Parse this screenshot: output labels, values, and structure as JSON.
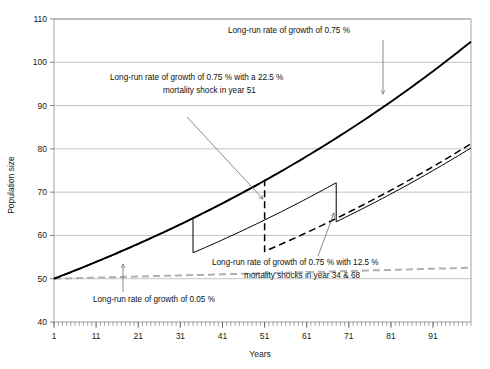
{
  "chart_data": {
    "type": "line",
    "title": "",
    "xlabel": "Years",
    "ylabel": "Population size",
    "xlim": [
      1,
      100
    ],
    "ylim": [
      40,
      110
    ],
    "yticks": [
      40,
      50,
      60,
      70,
      80,
      90,
      100,
      110
    ],
    "xticks": [
      1,
      11,
      21,
      31,
      41,
      51,
      61,
      71,
      81,
      91
    ],
    "xminor_step": 1,
    "grid": true,
    "legend": "none (in-plot text annotations with leader arrows)",
    "start_value": 50,
    "series": [
      {
        "name": "Long-run rate of growth of 0.75 %",
        "style": "solid-thick",
        "color": "#000000",
        "growth_rate_pct": 0.75,
        "shocks": [],
        "x": [
          1,
          11,
          21,
          31,
          41,
          51,
          61,
          71,
          81,
          91,
          100
        ],
        "values": [
          50.0,
          53.9,
          58.0,
          62.5,
          67.4,
          72.6,
          78.2,
          84.2,
          90.7,
          97.7,
          104.6
        ]
      },
      {
        "name": "Long-run rate of growth of 0.75 % with a 22.5 % mortality shock in year 51",
        "style": "dashed-black",
        "color": "#000000",
        "growth_rate_pct": 0.75,
        "shocks": [
          {
            "year": 51,
            "drop_pct": 22.5
          }
        ],
        "x": [
          1,
          11,
          21,
          31,
          41,
          50,
          51,
          61,
          71,
          81,
          91,
          100
        ],
        "values": [
          50.0,
          53.9,
          58.0,
          62.5,
          67.4,
          72.1,
          55.9,
          60.2,
          64.8,
          69.8,
          75.2,
          80.5
        ]
      },
      {
        "name": "Long-run rate of growth of 0.75 % with 12.5 % mortality shocks in year 34 & 68",
        "style": "solid-thin",
        "color": "#000000",
        "growth_rate_pct": 0.75,
        "shocks": [
          {
            "year": 34,
            "drop_pct": 12.5
          },
          {
            "year": 68,
            "drop_pct": 12.5
          }
        ],
        "x": [
          1,
          11,
          21,
          31,
          33,
          34,
          41,
          51,
          61,
          67,
          68,
          71,
          81,
          91,
          100
        ],
        "values": [
          50.0,
          53.9,
          58.0,
          62.5,
          64.4,
          56.3,
          59.4,
          64.0,
          68.9,
          72.1,
          63.1,
          64.5,
          69.5,
          74.9,
          80.2
        ]
      },
      {
        "name": "Long-run rate of growth of 0.05 %",
        "style": "dashed-gray",
        "color": "#b0b0b0",
        "growth_rate_pct": 0.05,
        "shocks": [],
        "note": "plotted slightly above the shocked series, reaching ~82 at year 100",
        "x": [
          1,
          11,
          21,
          31,
          41,
          51,
          61,
          71,
          81,
          91,
          100
        ],
        "values": [
          50.0,
          53.1,
          56.3,
          59.6,
          63.0,
          66.4,
          69.9,
          73.4,
          76.9,
          80.2,
          82.1
        ]
      }
    ],
    "annotations": [
      {
        "id": "annot-growth-075",
        "lines": [
          "Long-run rate of growth of 0.75 %"
        ],
        "text_x_px": 228,
        "text_y_px": 33,
        "arrow_from": [
          383,
          40
        ],
        "arrow_to": [
          383,
          94
        ]
      },
      {
        "id": "annot-shock-225",
        "lines": [
          "Long-run rate of growth of 0.75 % with a 22.5 %",
          "mortality shock in year 51"
        ],
        "text_x_px": 110,
        "text_y_px": 80,
        "arrow_from": [
          186,
          117
        ],
        "arrow_to": [
          265,
          200
        ]
      },
      {
        "id": "annot-shock-125",
        "lines": [
          "Long-run rate of growth of 0.75 % with 12.5 %",
          "mortality shocks in year 34 & 68"
        ],
        "text_x_px": 212,
        "text_y_px": 262,
        "arrow_from": [
          317,
          256
        ],
        "arrow_to": [
          333,
          214
        ]
      },
      {
        "id": "annot-growth-005",
        "lines": [
          "Long-run rate of growth of 0.05 %"
        ],
        "text_x_px": 93,
        "text_y_px": 299,
        "arrow_from": [
          123,
          292
        ],
        "arrow_to": [
          123,
          265
        ]
      }
    ]
  },
  "figure": {
    "ylabel": "Population size",
    "xlabel": "Years",
    "ytick_labels": [
      "110",
      "100",
      "90",
      "80",
      "70",
      "60",
      "50",
      "40"
    ],
    "xtick_labels": [
      "1",
      "11",
      "21",
      "31",
      "41",
      "51",
      "61",
      "71",
      "81",
      "91"
    ],
    "annot_growth_075": "Long-run rate of growth of 0.75 %",
    "annot_shock_225_l1": "Long-run rate of growth of 0.75 % with a 22.5 %",
    "annot_shock_225_l2": "mortality shock in year 51",
    "annot_shock_125_l1": "Long-run rate of growth of 0.75 % with 12.5 %",
    "annot_shock_125_l2": "mortality shocks in year 34 & 68",
    "annot_growth_005": "Long-run rate of growth of 0.05 %"
  },
  "colors": {
    "series_main": "#000000",
    "series_low_growth": "#b0b0b0",
    "grid": "#9a9a9a",
    "frame": "#8e8e8e",
    "text": "#111111"
  }
}
